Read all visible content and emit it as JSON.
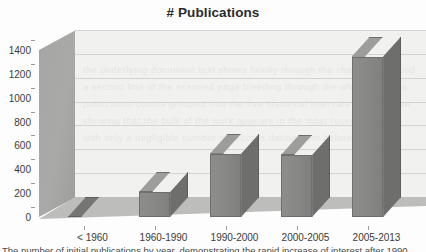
{
  "chart_data": {
    "type": "bar",
    "title": "# Publications",
    "subtitle": "",
    "xlabel": "",
    "ylabel": "",
    "categories": [
      "< 1960",
      "1960-1990",
      "1990-2000",
      "2000-2005",
      "2005-2013"
    ],
    "values": [
      10,
      210,
      530,
      520,
      1345
    ],
    "series": [
      {
        "name": "# Publications",
        "values": [
          10,
          210,
          530,
          520,
          1345
        ]
      }
    ],
    "ylim": [
      0,
      1400
    ],
    "yticks": [
      0,
      200,
      400,
      600,
      800,
      1000,
      1200,
      1400
    ],
    "ytick_labels": [
      "0",
      "200",
      "400",
      "600",
      "800",
      "1000",
      "1200",
      "1400"
    ],
    "grid": true,
    "gridlines": "horizontal",
    "legend": false,
    "legend_position": "none",
    "style": "3d-column",
    "colors": {
      "bar_front": "#8a8a88",
      "bar_top": "#9d9d9b",
      "bar_side": "#6e6e6c",
      "plot_background": "#f1f1ef",
      "wall": "#a6a6a4",
      "floor": "#bdbdbb",
      "gridline": "#d3d3d1",
      "text": "#3a3a3a",
      "title": "#2b2b2b"
    }
  },
  "bottom_text": "The number of initial publications by year, demonstrating the rapid increase of interest after 1990.",
  "watermark_lines": [
    "the underlying document text shows faintly through the chart background",
    "a second line of the scanned page bleeding through the white plot area",
    "publication counts grouped into the five historical intervals shown below",
    "showing that the bulk of the work appears in the most recent period",
    "with only a negligible number of records dating from before 1960"
  ]
}
